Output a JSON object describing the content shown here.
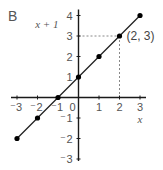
{
  "panel_label": "B",
  "chart_data": {
    "type": "line",
    "title": "",
    "xlabel": "x",
    "ylabel": "x + 1",
    "xlim": [
      -3,
      3
    ],
    "ylim": [
      -3,
      4
    ],
    "x_ticks": [
      -3,
      -2,
      -1,
      0,
      1,
      2,
      3
    ],
    "y_ticks": [
      -3,
      -2,
      -1,
      1,
      2,
      3,
      4
    ],
    "grid": false,
    "legend": null,
    "series": [
      {
        "name": "y = x + 1",
        "x": [
          -3,
          -2,
          -1,
          0,
          1,
          2,
          3
        ],
        "y": [
          -2,
          -1,
          0,
          1,
          2,
          3,
          4
        ],
        "markers": true
      }
    ],
    "annotations": [
      {
        "text": "(2, 3)",
        "x": 2,
        "y": 3,
        "dashed_guides": true
      }
    ]
  },
  "colors": {
    "axis": "#1a1a1a",
    "line": "#222222",
    "marker": "#000000",
    "tick_label": "#555555",
    "guide": "#888888"
  }
}
